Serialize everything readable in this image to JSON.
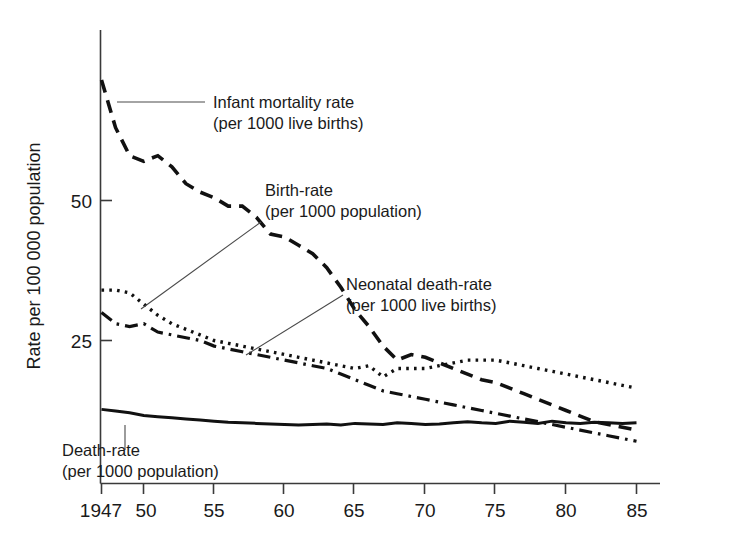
{
  "chart_data": {
    "type": "line",
    "title": "",
    "xlabel": "",
    "ylabel": "Rate per 100 000 population",
    "xlim": [
      1947,
      1985
    ],
    "ylim": [
      0,
      72
    ],
    "grid": false,
    "legend_position": "inline-annotations",
    "x_ticks": [
      1947,
      1950,
      1955,
      1960,
      1965,
      1970,
      1975,
      1980,
      1985
    ],
    "x_tick_labels": [
      "1947",
      "50",
      "55",
      "60",
      "65",
      "70",
      "75",
      "80",
      "85"
    ],
    "y_ticks": [
      25,
      50
    ],
    "y_tick_labels": [
      "25",
      "50"
    ],
    "x": [
      1947,
      1948,
      1949,
      1950,
      1951,
      1952,
      1953,
      1954,
      1955,
      1956,
      1957,
      1958,
      1959,
      1960,
      1961,
      1962,
      1963,
      1964,
      1965,
      1966,
      1967,
      1968,
      1969,
      1970,
      1971,
      1972,
      1973,
      1974,
      1975,
      1976,
      1977,
      1978,
      1979,
      1980,
      1981,
      1982,
      1983,
      1984,
      1985
    ],
    "series": [
      {
        "name": "Infant mortality rate",
        "units": "per 1000 live births",
        "style": "dashed",
        "values": [
          71.5,
          63.0,
          58.0,
          57.0,
          58.0,
          56.0,
          53.0,
          51.5,
          50.5,
          49.0,
          49.0,
          47.0,
          44.0,
          43.5,
          42.0,
          40.5,
          38.0,
          34.5,
          30.5,
          27.5,
          24.0,
          21.5,
          22.5,
          22.0,
          21.0,
          20.0,
          19.0,
          18.0,
          17.5,
          16.5,
          15.5,
          14.5,
          13.5,
          12.5,
          11.5,
          10.5,
          10.0,
          9.5,
          9.0
        ]
      },
      {
        "name": "Birth-rate",
        "units": "per 1000 population",
        "style": "dotted",
        "values": [
          34.0,
          34.0,
          33.5,
          31.5,
          29.5,
          28.0,
          27.0,
          26.0,
          25.0,
          24.5,
          24.0,
          23.5,
          23.0,
          22.5,
          22.0,
          21.5,
          21.0,
          20.5,
          20.0,
          20.5,
          18.5,
          20.0,
          20.0,
          20.0,
          20.5,
          21.0,
          21.5,
          21.5,
          21.5,
          21.0,
          20.5,
          20.0,
          19.5,
          19.0,
          18.5,
          18.0,
          17.5,
          17.0,
          16.5
        ]
      },
      {
        "name": "Neonatal death-rate",
        "units": "per 1000 live births",
        "style": "dashdot",
        "values": [
          30.0,
          28.0,
          27.5,
          28.0,
          26.5,
          26.0,
          25.5,
          25.0,
          24.0,
          23.5,
          23.0,
          22.5,
          22.0,
          21.5,
          21.0,
          20.5,
          20.0,
          19.0,
          18.0,
          17.0,
          16.0,
          15.5,
          15.0,
          14.5,
          14.0,
          13.5,
          13.0,
          12.5,
          12.0,
          11.5,
          11.0,
          10.5,
          10.0,
          9.5,
          9.0,
          8.5,
          8.0,
          7.5,
          7.0
        ]
      },
      {
        "name": "Death-rate",
        "units": "per 1000 population",
        "style": "solid",
        "values": [
          12.7,
          12.4,
          12.1,
          11.6,
          11.4,
          11.2,
          11.0,
          10.8,
          10.6,
          10.4,
          10.3,
          10.2,
          10.1,
          10.0,
          9.9,
          10.0,
          10.1,
          9.9,
          10.2,
          10.1,
          10.0,
          10.3,
          10.2,
          10.0,
          10.1,
          10.3,
          10.5,
          10.3,
          10.2,
          10.6,
          10.4,
          10.2,
          10.6,
          10.3,
          10.2,
          10.4,
          10.3,
          10.2,
          10.3
        ]
      }
    ]
  },
  "axes": {
    "y_label": "Rate per 100 000 population",
    "y_tick_50": "50",
    "y_tick_25": "25",
    "x_tick_1947": "1947",
    "x_tick_50": "50",
    "x_tick_55": "55",
    "x_tick_60": "60",
    "x_tick_65": "65",
    "x_tick_70": "70",
    "x_tick_75": "75",
    "x_tick_80": "80",
    "x_tick_85": "85"
  },
  "annotations": {
    "infant": {
      "line1": "Infant mortality rate",
      "line2": "(per 1000 live births)"
    },
    "birth": {
      "line1": "Birth-rate",
      "line2": "(per 1000 population)"
    },
    "neonatal": {
      "line1": "Neonatal death-rate",
      "line2": "(per 1000 live births)"
    },
    "death": {
      "line1": "Death-rate",
      "line2": "(per 1000 population)"
    }
  },
  "colors": {
    "ink": "#111111",
    "axis": "#3a3a3a",
    "background": "#ffffff"
  }
}
